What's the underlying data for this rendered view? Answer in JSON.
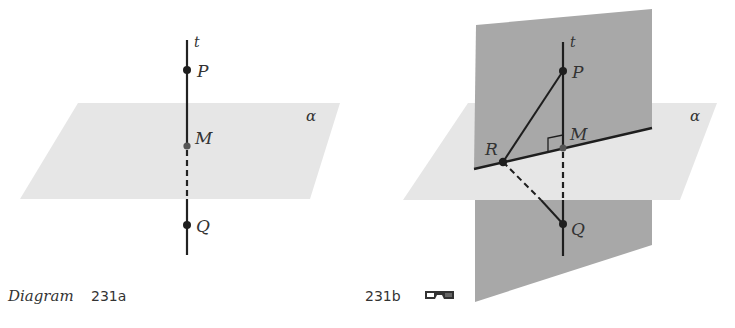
{
  "figure_a": {
    "caption_prefix": "Diagram",
    "caption_number": "231a",
    "plane_label": "α",
    "line_label": "t",
    "points": [
      {
        "name": "P"
      },
      {
        "name": "M"
      },
      {
        "name": "Q"
      }
    ]
  },
  "figure_b": {
    "caption_number": "231b",
    "caption_icon": "3d-glasses-icon",
    "plane_label": "α",
    "line_label": "t",
    "points": [
      {
        "name": "P"
      },
      {
        "name": "M"
      },
      {
        "name": "Q"
      },
      {
        "name": "R"
      }
    ],
    "right_angle_at": "M"
  },
  "colors": {
    "horizontal_plane": "#e6e6e6",
    "vertical_plane": "#a8a8a8",
    "line": "#1e1e1e"
  }
}
